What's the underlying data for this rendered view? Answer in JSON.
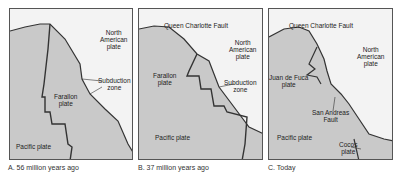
{
  "figure": {
    "colors": {
      "ocean_plate": "#c9c9c9",
      "continent": "#f3f3f3",
      "border": "#555555",
      "boundary": "#333333"
    },
    "panels": [
      {
        "id": "A",
        "caption": "A. 56 million years ago",
        "labels": {
          "north_american": "North\nAmerican\nplate",
          "subduction": "Subduction\nzone",
          "farallon": "Farallon\nplate",
          "pacific": "Pacific plate"
        }
      },
      {
        "id": "B",
        "caption": "B. 37 million years ago",
        "labels": {
          "queen_charlotte": "Queen Charlotte Fault",
          "north_american": "North\nAmerican\nplate",
          "farallon": "Farallon\nplate",
          "subduction": "Subduction\nzone",
          "pacific": "Pacific plate"
        }
      },
      {
        "id": "C",
        "caption": "C. Today",
        "labels": {
          "queen_charlotte": "Queen Charlotte Fault",
          "north_american": "North\nAmerican\nplate",
          "juan_de_fuca": "Juan de Fuca\nplate",
          "san_andreas": "San Andreas\nFault",
          "pacific": "Pacific plate",
          "cocos": "Cocos\nplate"
        }
      }
    ]
  }
}
